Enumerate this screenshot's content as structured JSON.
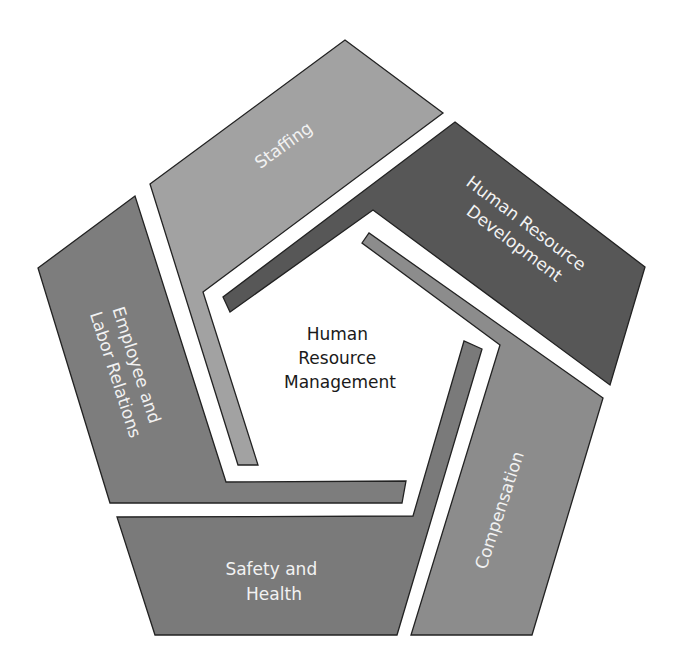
{
  "diagram": {
    "type": "pentagon-cycle",
    "center": {
      "lines": [
        "Human",
        "Resource",
        "Management"
      ]
    },
    "segments": [
      {
        "id": "staffing",
        "lines": [
          "Staffing"
        ],
        "color": "#a2a2a2"
      },
      {
        "id": "hrd",
        "lines": [
          "Human Resource",
          "Development"
        ],
        "color": "#575757"
      },
      {
        "id": "compensation",
        "lines": [
          "Compensation"
        ],
        "color": "#8c8c8c"
      },
      {
        "id": "safety",
        "lines": [
          "Safety and",
          "Health"
        ],
        "color": "#7a7a7a"
      },
      {
        "id": "employee",
        "lines": [
          "Employee and",
          "Labor Relations"
        ],
        "color": "#7d7d7d"
      }
    ]
  }
}
